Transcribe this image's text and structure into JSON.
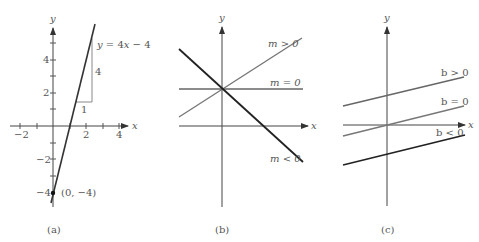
{
  "panels": [
    {
      "id": "a",
      "caption": "(a)",
      "axis_x_label": "x",
      "axis_y_label": "y",
      "x_ticks": [
        "−2",
        "2",
        "4"
      ],
      "y_ticks": [
        "4",
        "2",
        "−2",
        "−4"
      ],
      "equation_label": "y = 4x − 4",
      "rise_label": "4",
      "run_label": "1",
      "point_label": "(0, −4)"
    },
    {
      "id": "b",
      "caption": "(b)",
      "axis_x_label": "x",
      "axis_y_label": "y",
      "lines": [
        {
          "label": "m > 0"
        },
        {
          "label": "m = 0"
        },
        {
          "label": "m < 0"
        }
      ]
    },
    {
      "id": "c",
      "caption": "(c)",
      "axis_x_label": "x",
      "axis_y_label": "y",
      "lines": [
        {
          "label": "b > 0"
        },
        {
          "label": "b = 0"
        },
        {
          "label": "b < 0"
        }
      ]
    }
  ],
  "colors": {
    "axis": "#444444",
    "line_light": "#777777",
    "line_dark": "#222222",
    "label": "#555555"
  }
}
